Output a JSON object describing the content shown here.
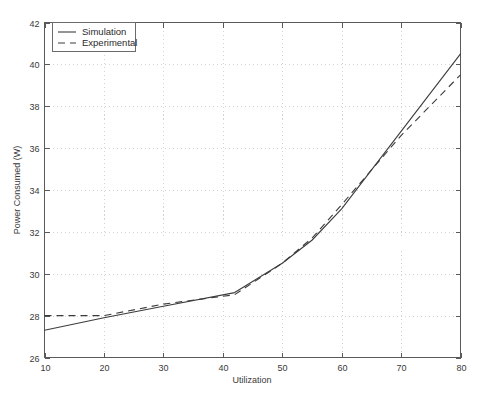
{
  "chart_data": {
    "type": "line",
    "title": "",
    "xlabel": "Utilization",
    "ylabel": "Power Consumed (W)",
    "xlim": [
      10,
      80
    ],
    "ylim": [
      26,
      42
    ],
    "xticks": [
      10,
      20,
      30,
      40,
      50,
      60,
      70,
      80
    ],
    "yticks": [
      26,
      28,
      30,
      32,
      34,
      36,
      38,
      40,
      42
    ],
    "xtick_labels": [
      "10",
      "20",
      "30",
      "40",
      "50",
      "60",
      "70",
      "80"
    ],
    "ytick_labels": [
      "26",
      "28",
      "30",
      "32",
      "34",
      "36",
      "38",
      "40",
      "42"
    ],
    "grid": true,
    "grid_style": "dotted",
    "legend_position": "top-left",
    "legend": [
      "Simulation",
      "Experimental"
    ],
    "series": [
      {
        "name": "Simulation",
        "style": "solid",
        "color": "#3c3c3c",
        "x": [
          10,
          20,
          30,
          42,
          50,
          55,
          60,
          70,
          80
        ],
        "values": [
          27.3,
          27.9,
          28.45,
          29.1,
          30.5,
          31.6,
          33.1,
          36.8,
          40.5
        ]
      },
      {
        "name": "Experimental",
        "style": "dashed",
        "color": "#3c3c3c",
        "x": [
          10,
          20,
          30,
          42,
          50,
          55,
          60,
          70,
          80
        ],
        "values": [
          28.0,
          28.0,
          28.55,
          29.0,
          30.5,
          31.7,
          33.3,
          36.6,
          39.5
        ]
      }
    ]
  },
  "legend": {
    "items": [
      {
        "label": "Simulation",
        "style": "solid"
      },
      {
        "label": "Experimental",
        "style": "dashed"
      }
    ]
  },
  "axes": {
    "x_title": "Utilization",
    "y_title": "Power Consumed (W)"
  }
}
